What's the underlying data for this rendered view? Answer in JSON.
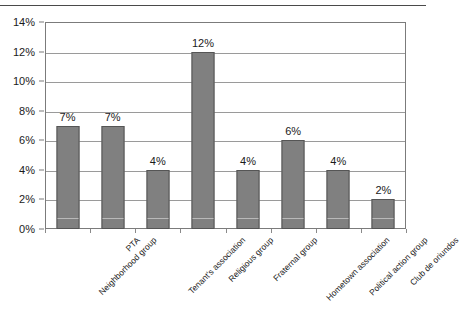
{
  "chart_data": {
    "type": "bar",
    "title": "",
    "subtitle": "",
    "xlabel": "",
    "ylabel": "",
    "categories": [
      "Neighborhood group",
      "PTA",
      "Tenant's association",
      "Religious group",
      "Fraternal group",
      "Hometown association",
      "Political action group",
      "Club de oriundos"
    ],
    "values": [
      7,
      7,
      4,
      12,
      4,
      6,
      4,
      2
    ],
    "data_labels": [
      "7%",
      "7%",
      "4%",
      "12%",
      "4%",
      "6%",
      "4%",
      "2%"
    ],
    "ylim": [
      0,
      14
    ],
    "ytick_values": [
      0,
      2,
      4,
      6,
      8,
      10,
      12,
      14
    ],
    "ytick_labels": [
      "0%",
      "2%",
      "4%",
      "6%",
      "8%",
      "10%",
      "12%",
      "14%"
    ],
    "grid": true,
    "grid_axis": "y",
    "legend": false,
    "legend_position": "none",
    "bar_color": "#808080",
    "bar_border_color": "#555555",
    "gridline_color": "#9a9a9a",
    "axis_color": "#7b7b7b",
    "background_color": "#ffffff",
    "value_unit": "percent"
  }
}
